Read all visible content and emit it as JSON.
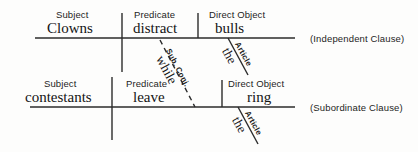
{
  "diagram": {
    "type": "reed-kellogg-sentence-diagram",
    "line_color": "#2b2b2b",
    "clauses": [
      {
        "id": "independent",
        "note": "(Independent Clause)",
        "slots": [
          {
            "role_label": "Subject",
            "word": "Clowns"
          },
          {
            "role_label": "Predicate",
            "word": "distract"
          },
          {
            "role_label": "Direct Object",
            "word": "bulls"
          }
        ],
        "modifiers": [
          {
            "tag": "Article",
            "word": "the",
            "attaches_to": "bulls"
          }
        ]
      },
      {
        "id": "subordinate",
        "note": "(Subordinate Clause)",
        "slots": [
          {
            "role_label": "Subject",
            "word": "contestants"
          },
          {
            "role_label": "Predicate",
            "word": "leave"
          },
          {
            "role_label": "Direct Object",
            "word": "ring"
          }
        ],
        "modifiers": [
          {
            "tag": "Article",
            "word": "the",
            "attaches_to": "ring"
          }
        ]
      }
    ],
    "connector": {
      "tag": "Sub. Conj.",
      "word": "while",
      "style": "dashed",
      "links": [
        "distract",
        "leave"
      ]
    }
  }
}
